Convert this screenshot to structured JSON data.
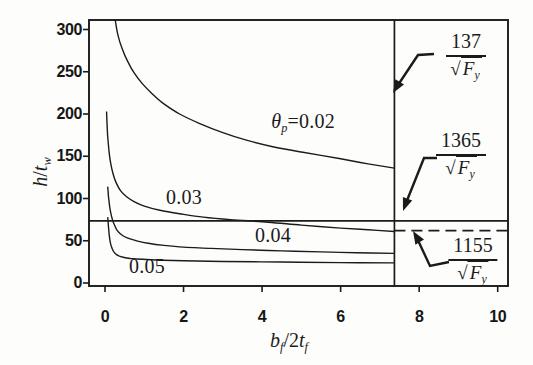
{
  "chart_data": {
    "type": "line",
    "title": "",
    "xlabel": "bf/2tf",
    "ylabel": "h/tw",
    "xlabel_parts": {
      "base1": "b",
      "sub1": "f",
      "mid": "/2",
      "base2": "t",
      "sub2": "f"
    },
    "ylabel_parts": {
      "base1": "h",
      "mid": "/",
      "base2": "t",
      "sub2": "w"
    },
    "xlim": [
      -0.4,
      10.3
    ],
    "ylim": [
      0,
      312
    ],
    "x_ticks": [
      0,
      2,
      4,
      6,
      8,
      10
    ],
    "y_ticks": [
      0,
      50,
      100,
      150,
      200,
      250,
      300
    ],
    "grid": false,
    "legend": "inline-curve-labels",
    "series": [
      {
        "name": "theta_p = 0.02",
        "label_prefix": "θ",
        "label_sub": "p",
        "label_value": "=0.02",
        "points": [
          [
            0.26,
            311
          ],
          [
            0.33,
            293
          ],
          [
            0.44,
            277
          ],
          [
            0.58,
            262
          ],
          [
            0.75,
            248
          ],
          [
            0.95,
            236
          ],
          [
            1.2,
            224
          ],
          [
            1.5,
            212
          ],
          [
            1.9,
            200
          ],
          [
            2.4,
            189
          ],
          [
            3.0,
            178
          ],
          [
            3.6,
            169
          ],
          [
            4.3,
            161
          ],
          [
            5.0,
            155
          ],
          [
            6.0,
            147
          ],
          [
            6.7,
            141
          ],
          [
            7.37,
            136
          ]
        ]
      },
      {
        "name": "theta_p = 0.03",
        "label_prefix": "",
        "label_sub": "",
        "label_value": "0.03",
        "points": [
          [
            0.04,
            203
          ],
          [
            0.05,
            190
          ],
          [
            0.07,
            173
          ],
          [
            0.1,
            157
          ],
          [
            0.14,
            143
          ],
          [
            0.2,
            130
          ],
          [
            0.28,
            119
          ],
          [
            0.4,
            109
          ],
          [
            0.55,
            102
          ],
          [
            0.75,
            96
          ],
          [
            1.0,
            91
          ],
          [
            1.4,
            86
          ],
          [
            1.9,
            82
          ],
          [
            2.5,
            78
          ],
          [
            3.2,
            75
          ],
          [
            4.15,
            72
          ],
          [
            5.0,
            68.5
          ],
          [
            6.0,
            65
          ],
          [
            6.7,
            63
          ],
          [
            7.37,
            61
          ]
        ]
      },
      {
        "name": "theta_p = 0.04",
        "label_prefix": "",
        "label_sub": "",
        "label_value": "0.04",
        "points": [
          [
            0.07,
            114
          ],
          [
            0.09,
            102
          ],
          [
            0.12,
            90
          ],
          [
            0.16,
            80
          ],
          [
            0.22,
            71
          ],
          [
            0.3,
            63
          ],
          [
            0.42,
            57
          ],
          [
            0.58,
            53
          ],
          [
            0.8,
            50
          ],
          [
            1.1,
            47
          ],
          [
            1.5,
            44.5
          ],
          [
            2.0,
            42.5
          ],
          [
            2.7,
            41
          ],
          [
            3.5,
            39.5
          ],
          [
            4.5,
            38
          ],
          [
            5.5,
            36.8
          ],
          [
            6.4,
            35.8
          ],
          [
            7.37,
            35
          ]
        ]
      },
      {
        "name": "theta_p = 0.05",
        "label_prefix": "",
        "label_sub": "",
        "label_value": "0.05",
        "points": [
          [
            0.07,
            78
          ],
          [
            0.09,
            66
          ],
          [
            0.11,
            56
          ],
          [
            0.14,
            47
          ],
          [
            0.18,
            41
          ],
          [
            0.24,
            36
          ],
          [
            0.33,
            32.5
          ],
          [
            0.46,
            30.5
          ],
          [
            0.65,
            29
          ],
          [
            0.95,
            28
          ],
          [
            1.4,
            27
          ],
          [
            2.0,
            26.3
          ],
          [
            3.0,
            25.5
          ],
          [
            4.5,
            24.8
          ],
          [
            6.0,
            24.2
          ],
          [
            7.37,
            23.8
          ]
        ]
      }
    ],
    "reference_lines": [
      {
        "name": "flange-slenderness-limit",
        "orientation": "vertical",
        "value": 7.37,
        "style": "solid"
      },
      {
        "name": "web-slenderness-limit-1365",
        "orientation": "horizontal",
        "value": 73.5,
        "style": "solid"
      },
      {
        "name": "web-slenderness-limit-1155",
        "orientation": "horizontal",
        "value": 62,
        "style": "dashed",
        "x_start": 7.37,
        "x_end": 10.3
      }
    ],
    "annotations": [
      {
        "numerator": "137",
        "sqrt": "√",
        "radicand": "F",
        "radicand_sub": "y",
        "target": "vertical-solid-line"
      },
      {
        "numerator": "1365",
        "sqrt": "√",
        "radicand": "F",
        "radicand_sub": "y",
        "target": "horizontal-solid-line"
      },
      {
        "numerator": "1155",
        "sqrt": "√",
        "radicand": "F",
        "radicand_sub": "y",
        "target": "horizontal-dashed-line"
      }
    ]
  },
  "colors": {
    "ink": "#1b1b1b",
    "background": "#fdfdfc"
  }
}
